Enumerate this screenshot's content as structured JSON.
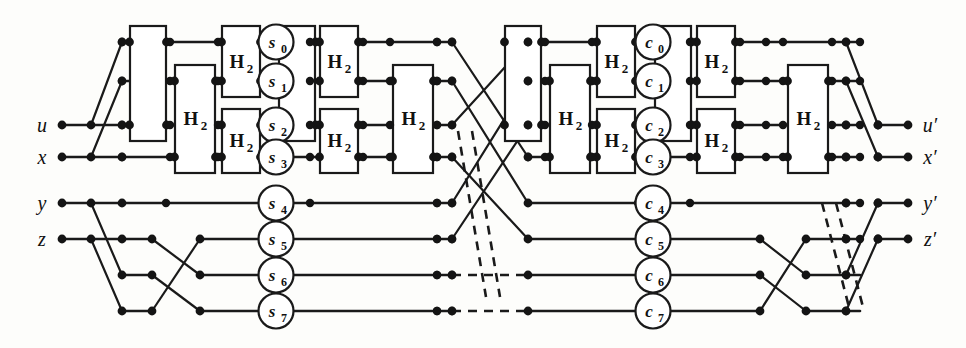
{
  "figure": {
    "kind": "circuit-diagram",
    "title": "",
    "rows": 8,
    "stage": {
      "width": 966,
      "height": 348
    }
  },
  "colors": {
    "ink": "#1a1a1a",
    "paper": "#fdfdfb",
    "node": "#141414",
    "box_fill": "#ffffff"
  },
  "inputs": [
    {
      "label": "u",
      "row": 2,
      "x": 62,
      "y": 125
    },
    {
      "label": "x",
      "row": 3,
      "x": 62,
      "y": 157
    },
    {
      "label": "y",
      "row": 4,
      "x": 62,
      "y": 203
    },
    {
      "label": "z",
      "row": 5,
      "x": 62,
      "y": 239
    }
  ],
  "outputs": [
    {
      "label": "u′",
      "row": 2,
      "x": 908,
      "y": 125
    },
    {
      "label": "x′",
      "row": 3,
      "x": 908,
      "y": 157
    },
    {
      "label": "y′",
      "row": 4,
      "x": 908,
      "y": 203
    },
    {
      "label": "z′",
      "row": 5,
      "x": 908,
      "y": 239
    }
  ],
  "left_cells": [
    {
      "label": "s",
      "sub": "0",
      "row": 0
    },
    {
      "label": "s",
      "sub": "1",
      "row": 1
    },
    {
      "label": "s",
      "sub": "2",
      "row": 2
    },
    {
      "label": "s",
      "sub": "3",
      "row": 3
    },
    {
      "label": "s",
      "sub": "4",
      "row": 4
    },
    {
      "label": "s",
      "sub": "5",
      "row": 5
    },
    {
      "label": "s",
      "sub": "6",
      "row": 6
    },
    {
      "label": "s",
      "sub": "7",
      "row": 7
    }
  ],
  "right_cells": [
    {
      "label": "c",
      "sub": "0",
      "row": 0
    },
    {
      "label": "c",
      "sub": "1",
      "row": 1
    },
    {
      "label": "c",
      "sub": "2",
      "row": 2
    },
    {
      "label": "c",
      "sub": "3",
      "row": 3
    },
    {
      "label": "c",
      "sub": "4",
      "row": 4
    },
    {
      "label": "c",
      "sub": "5",
      "row": 5
    },
    {
      "label": "c",
      "sub": "6",
      "row": 6
    },
    {
      "label": "c",
      "sub": "7",
      "row": 7
    }
  ],
  "gates": [
    {
      "id": "L-h1",
      "label": "H",
      "sub": "2",
      "x": 175,
      "w": 40,
      "row_top": 1,
      "row_bot": 3
    },
    {
      "id": "L-h2",
      "label": "H",
      "sub": "2",
      "x": 222,
      "w": 38,
      "row_top": 2,
      "row_bot": 3
    },
    {
      "id": "L-h3",
      "label": "H",
      "sub": "2",
      "x": 222,
      "w": 38,
      "row_top": 0,
      "row_bot": 1
    },
    {
      "id": "L-h4",
      "label": "H",
      "sub": "2",
      "x": 320,
      "w": 38,
      "row_top": 0,
      "row_bot": 1
    },
    {
      "id": "L-h5",
      "label": "H",
      "sub": "2",
      "x": 320,
      "w": 38,
      "row_top": 2,
      "row_bot": 3
    },
    {
      "id": "L-h6",
      "label": "H",
      "sub": "2",
      "x": 393,
      "w": 40,
      "row_top": 1,
      "row_bot": 3
    },
    {
      "id": "R-h1",
      "label": "H",
      "sub": "2",
      "x": 550,
      "w": 40,
      "row_top": 1,
      "row_bot": 3
    },
    {
      "id": "R-h2",
      "label": "H",
      "sub": "2",
      "x": 597,
      "w": 38,
      "row_top": 2,
      "row_bot": 3
    },
    {
      "id": "R-h3",
      "label": "H",
      "sub": "2",
      "x": 597,
      "w": 38,
      "row_top": 0,
      "row_bot": 1
    },
    {
      "id": "R-h4",
      "label": "H",
      "sub": "2",
      "x": 697,
      "w": 38,
      "row_top": 0,
      "row_bot": 1
    },
    {
      "id": "R-h5",
      "label": "H",
      "sub": "2",
      "x": 697,
      "w": 38,
      "row_top": 2,
      "row_bot": 3
    },
    {
      "id": "R-h6",
      "label": "H",
      "sub": "2",
      "x": 788,
      "w": 40,
      "row_top": 1,
      "row_bot": 3
    }
  ],
  "swap_boxes": [
    {
      "id": "L-sw1",
      "x": 130,
      "w": 36,
      "row_top": 0,
      "row_bot": 2
    },
    {
      "id": "L-sw2",
      "x": 279,
      "w": 36,
      "row_top": 0,
      "row_bot": 2
    },
    {
      "id": "R-sw1",
      "x": 505,
      "w": 36,
      "row_top": 0,
      "row_bot": 2
    },
    {
      "id": "R-sw2",
      "x": 655,
      "w": 36,
      "row_top": 0,
      "row_bot": 2
    }
  ]
}
